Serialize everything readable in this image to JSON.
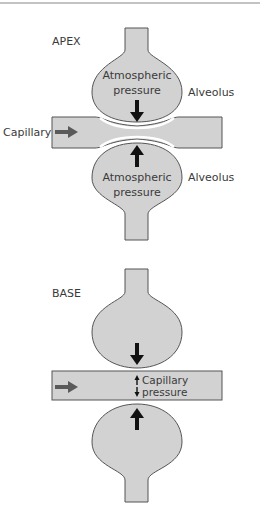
{
  "colors": {
    "fill": "#d2d2d2",
    "stroke": "#555555",
    "arrow_dark": "#111111",
    "flow_arrow": "#5a5a5a",
    "text": "#3a3a3a",
    "top_rule": "#888888"
  },
  "apex": {
    "title": "APEX",
    "capillary_label": "Capillary",
    "upper_alveolus": {
      "label": "Alveolus",
      "pressure_line1": "Atmospheric",
      "pressure_line2": "pressure"
    },
    "lower_alveolus": {
      "label": "Alveolus",
      "pressure_line1": "Atmospheric",
      "pressure_line2": "pressure"
    }
  },
  "base": {
    "title": "BASE",
    "capillary_pressure_line1": "Capillary",
    "capillary_pressure_line2": "pressure"
  }
}
